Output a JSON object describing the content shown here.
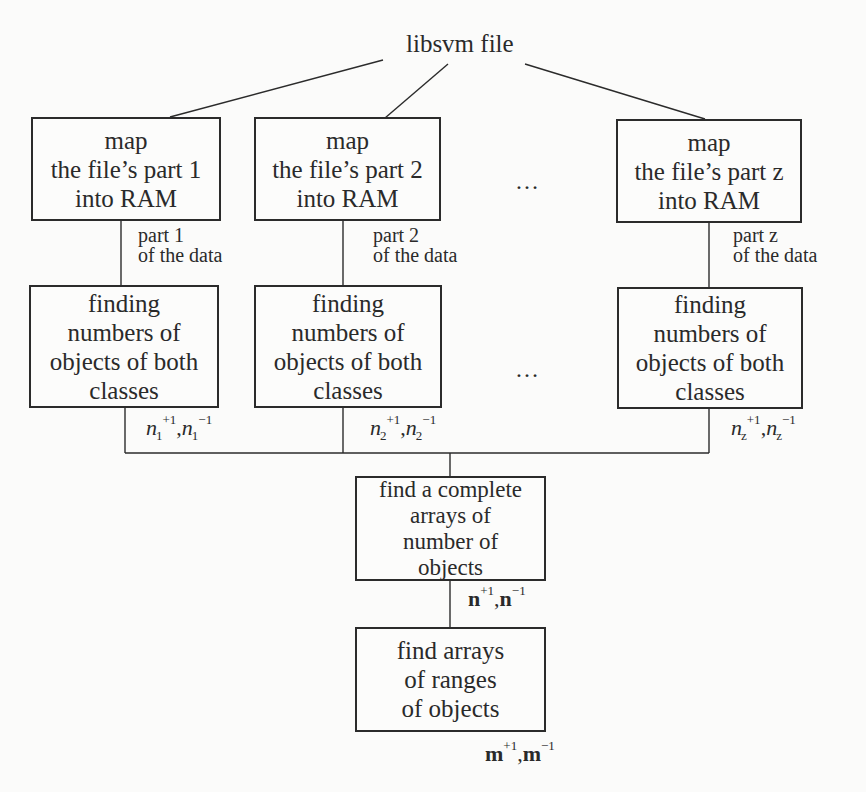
{
  "diagram": {
    "title": "libsvm file",
    "map_boxes": [
      {
        "lines": [
          "map",
          "the file’s part 1",
          "into RAM"
        ]
      },
      {
        "lines": [
          "map",
          "the file’s part 2",
          "into RAM"
        ]
      },
      {
        "lines": [
          "map",
          "the file’s part z",
          "into RAM"
        ]
      }
    ],
    "data_labels": [
      {
        "line1": "part 1",
        "line2": "of the data"
      },
      {
        "line1": "part 2",
        "line2": "of the data"
      },
      {
        "line1": "part z",
        "line2": "of the data"
      }
    ],
    "finding_boxes": [
      {
        "lines": [
          "finding",
          "numbers of",
          "objects of both",
          "classes"
        ]
      },
      {
        "lines": [
          "finding",
          "numbers of",
          "objects of both",
          "classes"
        ]
      },
      {
        "lines": [
          "finding",
          "numbers of",
          "objects of both",
          "classes"
        ]
      }
    ],
    "count_labels": [
      {
        "var": "n",
        "sub": "1",
        "sup_pos": "+1",
        "sup_neg": "−1",
        "sep": ","
      },
      {
        "var": "n",
        "sub": "2",
        "sup_pos": "+1",
        "sup_neg": "−1",
        "sep": ","
      },
      {
        "var": "n",
        "sub": "z",
        "sup_pos": "+1",
        "sup_neg": "−1",
        "sep": ","
      }
    ],
    "ellipsis": "…",
    "complete_box": {
      "lines": [
        "find a complete",
        "arrays of",
        "number of",
        "objects"
      ]
    },
    "complete_label": {
      "var": "n",
      "sup_pos": "+1",
      "sup_neg": "−1",
      "sep": ","
    },
    "ranges_box": {
      "lines": [
        "find arrays",
        "of ranges",
        "of objects"
      ]
    },
    "ranges_label": {
      "var": "m",
      "sup_pos": "+1",
      "sup_neg": "−1",
      "sep": ","
    }
  },
  "colors": {
    "stroke": "#2b2b2b",
    "background": "#fbfbfa",
    "text": "#2a2a2a"
  }
}
